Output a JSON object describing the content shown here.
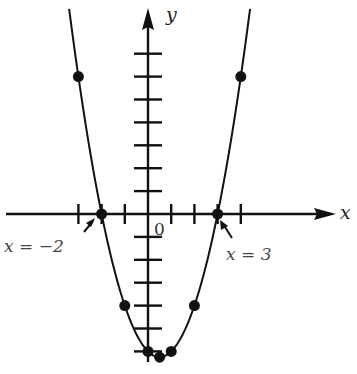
{
  "chart_data": {
    "type": "line",
    "title": "",
    "xlabel": "x",
    "ylabel": "y",
    "function": "y = x^2 - x - 6 = (x + 2)(x - 3)",
    "origin_label": "0",
    "x_ticks": [
      -3,
      -2,
      -1,
      1,
      2,
      3,
      4
    ],
    "y_ticks": [
      -6,
      -5,
      -4,
      -3,
      -2,
      -1,
      1,
      2,
      3,
      4,
      5,
      6,
      7
    ],
    "xlim": [
      -6.3,
      8.8
    ],
    "ylim": [
      -6.6,
      9.3
    ],
    "grid": false,
    "points": [
      {
        "x": -3,
        "y": 6
      },
      {
        "x": -2,
        "y": 0
      },
      {
        "x": -1,
        "y": -4
      },
      {
        "x": 0,
        "y": -6
      },
      {
        "x": 0.5,
        "y": -6.25
      },
      {
        "x": 1,
        "y": -6
      },
      {
        "x": 2,
        "y": -4
      },
      {
        "x": 3,
        "y": 0
      },
      {
        "x": 4,
        "y": 6
      }
    ],
    "annotations": [
      {
        "text": "x = −2",
        "points_to": {
          "x": -2,
          "y": 0
        }
      },
      {
        "text": "x = 3",
        "points_to": {
          "x": 3,
          "y": 0
        }
      }
    ]
  },
  "labels": {
    "x_axis": "x",
    "y_axis": "y",
    "origin": "0",
    "root_left": "x = −2",
    "root_right": "x = 3"
  },
  "colors": {
    "ink": "#111111",
    "label": "#444444",
    "background": "#ffffff"
  }
}
